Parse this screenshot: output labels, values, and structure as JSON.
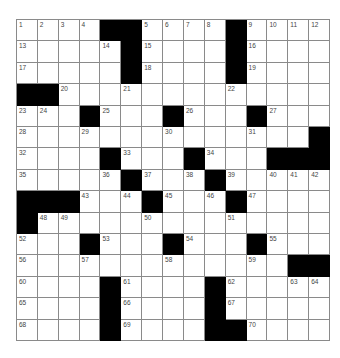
{
  "puzzle": {
    "rows": 15,
    "cols": 15,
    "colors": {
      "black": "#000000",
      "white": "#ffffff",
      "line": "#8a8a8a",
      "number": "#444444"
    },
    "grid": [
      [
        "1",
        "2",
        "3",
        "4",
        "#",
        "#",
        "5",
        "6",
        "7",
        "8",
        "#",
        "9",
        "10",
        "11",
        "12"
      ],
      [
        "13",
        "",
        "",
        "",
        "14",
        "#",
        "15",
        "",
        "",
        "",
        "#",
        "16",
        "",
        "",
        ""
      ],
      [
        "17",
        "",
        "",
        "",
        "",
        "#",
        "18",
        "",
        "",
        "",
        "#",
        "19",
        "",
        "",
        ""
      ],
      [
        "#",
        "#",
        "20",
        "",
        "",
        "21",
        "",
        "",
        "",
        "",
        "22",
        "",
        "",
        "",
        ""
      ],
      [
        "23",
        "24",
        "",
        "#",
        "25",
        "",
        "",
        "#",
        "26",
        "",
        "",
        "#",
        "27",
        "",
        ""
      ],
      [
        "28",
        "",
        "",
        "29",
        "",
        "",
        "",
        "30",
        "",
        "",
        "",
        "31",
        "",
        "",
        "#"
      ],
      [
        "32",
        "",
        "",
        "",
        "#",
        "33",
        "",
        "",
        "#",
        "34",
        "",
        "",
        "#",
        "#",
        "#"
      ],
      [
        "35",
        "",
        "",
        "",
        "36",
        "#",
        "37",
        "",
        "38",
        "#",
        "39",
        "",
        "40",
        "41",
        "42"
      ],
      [
        "#",
        "#",
        "#",
        "43",
        "",
        "44",
        "#",
        "45",
        "",
        "46",
        "#",
        "47",
        "",
        "",
        ""
      ],
      [
        "#",
        "48",
        "49",
        "",
        "",
        "",
        "50",
        "",
        "",
        "",
        "51",
        "",
        "",
        "",
        ""
      ],
      [
        "52",
        "",
        "",
        "#",
        "53",
        "",
        "",
        "#",
        "54",
        "",
        "",
        "#",
        "55",
        "",
        ""
      ],
      [
        "56",
        "",
        "",
        "57",
        "",
        "",
        "",
        "58",
        "",
        "",
        "",
        "59",
        "",
        "#",
        "#"
      ],
      [
        "60",
        "",
        "",
        "",
        "#",
        "61",
        "",
        "",
        "",
        "#",
        "62",
        "",
        "",
        "63",
        "64"
      ],
      [
        "65",
        "",
        "",
        "",
        "#",
        "66",
        "",
        "",
        "",
        "#",
        "67",
        "",
        "",
        "",
        ""
      ],
      [
        "68",
        "",
        "",
        "",
        "#",
        "69",
        "",
        "",
        "",
        "#",
        "#",
        "70",
        "",
        "",
        ""
      ]
    ]
  }
}
